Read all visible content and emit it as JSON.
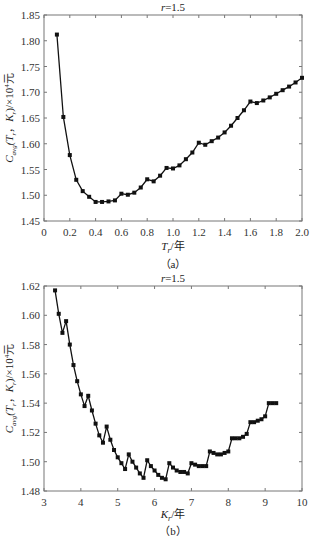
{
  "chart_data": [
    {
      "type": "line",
      "panel": "(a)",
      "title": "r=1.5",
      "xlabel": "T_r/年",
      "ylabel": "C_avg(T_r, K_r)/×10^4元",
      "xlim": [
        0,
        2.0
      ],
      "ylim": [
        1.45,
        1.85
      ],
      "xticks": [
        "0",
        "0.2",
        "0.4",
        "0.6",
        "0.8",
        "1.0",
        "1.2",
        "1.4",
        "1.6",
        "1.8",
        "2.0"
      ],
      "yticks": [
        "1.45",
        "1.50",
        "1.55",
        "1.60",
        "1.65",
        "1.70",
        "1.75",
        "1.80",
        "1.85"
      ],
      "grid": false,
      "series": [
        {
          "name": "C_avg",
          "x": [
            0.1,
            0.15,
            0.2,
            0.25,
            0.3,
            0.35,
            0.4,
            0.45,
            0.5,
            0.55,
            0.6,
            0.65,
            0.7,
            0.75,
            0.8,
            0.85,
            0.9,
            0.95,
            1.0,
            1.05,
            1.1,
            1.15,
            1.2,
            1.25,
            1.3,
            1.35,
            1.4,
            1.45,
            1.5,
            1.55,
            1.6,
            1.65,
            1.7,
            1.75,
            1.8,
            1.85,
            1.9,
            1.95,
            2.0
          ],
          "values": [
            1.812,
            1.652,
            1.578,
            1.53,
            1.508,
            1.497,
            1.487,
            1.487,
            1.488,
            1.49,
            1.503,
            1.501,
            1.505,
            1.515,
            1.531,
            1.527,
            1.538,
            1.553,
            1.552,
            1.558,
            1.57,
            1.583,
            1.602,
            1.598,
            1.605,
            1.612,
            1.622,
            1.635,
            1.65,
            1.665,
            1.682,
            1.679,
            1.684,
            1.69,
            1.697,
            1.704,
            1.711,
            1.719,
            1.728
          ]
        }
      ]
    },
    {
      "type": "line",
      "panel": "(b)",
      "title": "r=1.5",
      "xlabel": "K_r/年",
      "ylabel": "C_avg(T_r, K_r)/×10^4元",
      "xlim": [
        3,
        10
      ],
      "ylim": [
        1.48,
        1.62
      ],
      "xticks": [
        "3",
        "4",
        "5",
        "6",
        "7",
        "8",
        "9",
        "10"
      ],
      "yticks": [
        "1.48",
        "1.50",
        "1.52",
        "1.54",
        "1.56",
        "1.58",
        "1.60",
        "1.62"
      ],
      "grid": false,
      "series": [
        {
          "name": "C_avg",
          "x": [
            3.3,
            3.4,
            3.5,
            3.6,
            3.7,
            3.8,
            3.9,
            4.0,
            4.1,
            4.2,
            4.3,
            4.4,
            4.5,
            4.6,
            4.7,
            4.8,
            4.9,
            5.0,
            5.1,
            5.2,
            5.3,
            5.4,
            5.5,
            5.6,
            5.7,
            5.8,
            5.9,
            6.0,
            6.1,
            6.2,
            6.3,
            6.4,
            6.5,
            6.6,
            6.7,
            6.8,
            6.9,
            7.0,
            7.1,
            7.2,
            7.3,
            7.4,
            7.5,
            7.6,
            7.7,
            7.8,
            7.9,
            8.0,
            8.1,
            8.2,
            8.3,
            8.4,
            8.5,
            8.6,
            8.7,
            8.8,
            8.9,
            9.0,
            9.1,
            9.2,
            9.3
          ],
          "values": [
            1.617,
            1.601,
            1.588,
            1.596,
            1.58,
            1.566,
            1.555,
            1.546,
            1.538,
            1.545,
            1.535,
            1.526,
            1.518,
            1.513,
            1.524,
            1.515,
            1.508,
            1.503,
            1.499,
            1.495,
            1.505,
            1.5,
            1.496,
            1.492,
            1.489,
            1.501,
            1.497,
            1.494,
            1.491,
            1.489,
            1.488,
            1.499,
            1.496,
            1.494,
            1.493,
            1.493,
            1.492,
            1.499,
            1.498,
            1.497,
            1.497,
            1.497,
            1.507,
            1.506,
            1.505,
            1.505,
            1.506,
            1.507,
            1.516,
            1.516,
            1.516,
            1.517,
            1.519,
            1.527,
            1.527,
            1.528,
            1.529,
            1.531,
            1.54,
            1.54,
            1.54
          ]
        }
      ]
    }
  ],
  "captions": {
    "a": "（a）",
    "b": "（b）"
  }
}
